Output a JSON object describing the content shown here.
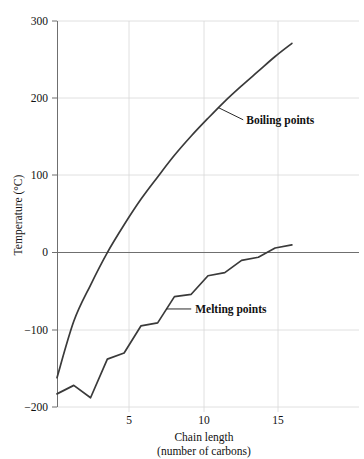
{
  "chart_data": {
    "type": "line",
    "title": "",
    "xlabel": "Chain length",
    "xlabel_line2": "(number of carbons)",
    "ylabel": "Temperature (°C)",
    "xlim": [
      1,
      19
    ],
    "ylim": [
      -200,
      300
    ],
    "xticks": [
      5,
      10,
      15
    ],
    "xtick_labels": [
      "5",
      "10",
      "15"
    ],
    "yticks": [
      -200,
      -100,
      0,
      100,
      200,
      300
    ],
    "ytick_labels": [
      "−200",
      "−100",
      "0",
      "100",
      "200",
      "300"
    ],
    "grid": true,
    "legend_position": "inline-annotations",
    "x": [
      1,
      2,
      3,
      4,
      5,
      6,
      7,
      8,
      9,
      10,
      11,
      12,
      13,
      14,
      15
    ],
    "series": [
      {
        "name": "Boiling points",
        "label": "Boiling points",
        "color": "#3a3a3a",
        "values": [
          -162,
          -89,
          -42,
          0,
          36,
          69,
          98,
          126,
          151,
          174,
          196,
          216,
          235,
          254,
          271
        ]
      },
      {
        "name": "Melting points",
        "label": "Melting points",
        "color": "#3a3a3a",
        "values": [
          -183,
          -172,
          -188,
          -138,
          -130,
          -95,
          -91,
          -57,
          -54,
          -30,
          -26,
          -10,
          -6,
          6,
          10
        ]
      }
    ],
    "annotations": [
      {
        "text": "Boiling points",
        "target_x": 10.6,
        "target_y": 188,
        "label_x": 12.1,
        "label_y": 172
      },
      {
        "text": "Melting points",
        "target_x": 7.5,
        "target_y": -73,
        "label_x": 9.0,
        "label_y": -73
      }
    ]
  },
  "axes": {
    "y_title": "Temperature (°C)",
    "x_title_line1": "Chain length",
    "x_title_line2": "(number of carbons)"
  },
  "colors": {
    "series_stroke": "#3a3a3a",
    "gridline": "#d8d8d8",
    "axis": "#6f6f6f",
    "text": "#111111",
    "background": "#ffffff"
  }
}
